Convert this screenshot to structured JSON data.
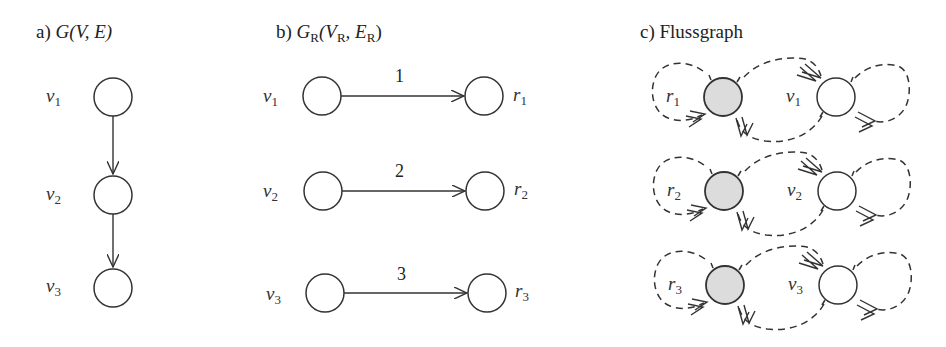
{
  "figure": {
    "panels": [
      {
        "id": "a",
        "title_prefix": "a) ",
        "title_math": "G(V, E)",
        "nodes": [
          {
            "label": "v",
            "sub": "1"
          },
          {
            "label": "v",
            "sub": "2"
          },
          {
            "label": "v",
            "sub": "3"
          }
        ],
        "edges": [
          {
            "from": "v1",
            "to": "v2"
          },
          {
            "from": "v2",
            "to": "v3"
          }
        ]
      },
      {
        "id": "b",
        "title_prefix": "b)  ",
        "title_G": "G",
        "title_G_sub": "R",
        "title_args": "(V",
        "title_VR_sub": "R",
        "title_comma": ", E",
        "title_ER_sub": "R",
        "title_close": ")",
        "rows": [
          {
            "left": {
              "label": "v",
              "sub": "1"
            },
            "right": {
              "label": "r",
              "sub": "1"
            },
            "edge_label": "1"
          },
          {
            "left": {
              "label": "v",
              "sub": "2"
            },
            "right": {
              "label": "r",
              "sub": "2"
            },
            "edge_label": "2"
          },
          {
            "left": {
              "label": "v",
              "sub": "3"
            },
            "right": {
              "label": "r",
              "sub": "3"
            },
            "edge_label": "3"
          }
        ]
      },
      {
        "id": "c",
        "title": "c) Flussgraph",
        "rows": [
          {
            "shaded": {
              "label": "r",
              "sub": "1"
            },
            "plain": {
              "label": "v",
              "sub": "1"
            }
          },
          {
            "shaded": {
              "label": "r",
              "sub": "2"
            },
            "plain": {
              "label": "v",
              "sub": "2"
            }
          },
          {
            "shaded": {
              "label": "r",
              "sub": "3"
            },
            "plain": {
              "label": "v",
              "sub": "3"
            }
          }
        ]
      }
    ],
    "colors": {
      "stroke": "#333333",
      "shaded_fill": "#dcdcdc",
      "background": "#ffffff"
    }
  }
}
